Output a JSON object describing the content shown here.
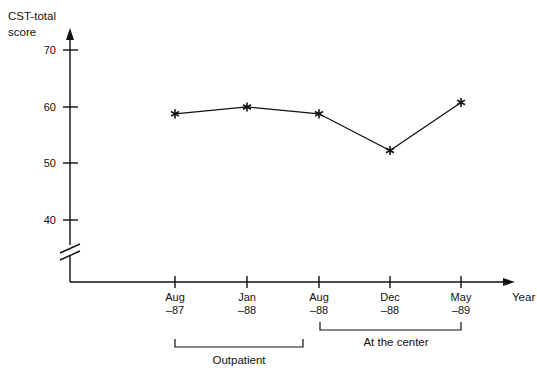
{
  "chart_data": {
    "type": "line",
    "title": "",
    "ylabel_line1": "CST-total",
    "ylabel_line2": "score",
    "xlabel": "Year",
    "categories": [
      "Aug -87",
      "Jan -88",
      "Aug -88",
      "Dec -88",
      "May -89"
    ],
    "category_labels": [
      {
        "top": "Aug",
        "bottom": "–87"
      },
      {
        "top": "Jan",
        "bottom": "–88"
      },
      {
        "top": "Aug",
        "bottom": "–88"
      },
      {
        "top": "Dec",
        "bottom": "–88"
      },
      {
        "top": "May",
        "bottom": "–89"
      }
    ],
    "values": [
      58.8,
      60.0,
      58.8,
      52.3,
      60.8
    ],
    "ytick_labels": [
      "70",
      "60",
      "50",
      "40"
    ],
    "yticks": [
      70,
      60,
      50,
      40
    ],
    "ylim": [
      40,
      70
    ],
    "axis_break": true,
    "grid": false,
    "legend": "none",
    "marker": "asterisk",
    "line_color": "#111111",
    "annotations": [
      {
        "label": "Outpatient",
        "from": "Aug -87",
        "to": "Aug -88"
      },
      {
        "label": "At the center",
        "from": "Aug -88",
        "to": "May -89"
      }
    ]
  },
  "axis": {
    "y_title_line1": "CST-total",
    "y_title_line2": "score",
    "x_title": "Year"
  },
  "ticks": {
    "y": [
      "70",
      "60",
      "50",
      "40"
    ]
  },
  "xcats": {
    "c0_top": "Aug",
    "c0_bot": "–87",
    "c1_top": "Jan",
    "c1_bot": "–88",
    "c2_top": "Aug",
    "c2_bot": "–88",
    "c3_top": "Dec",
    "c3_bot": "–88",
    "c4_top": "May",
    "c4_bot": "–89"
  },
  "brackets": {
    "outpatient": "Outpatient",
    "center": "At the center"
  }
}
